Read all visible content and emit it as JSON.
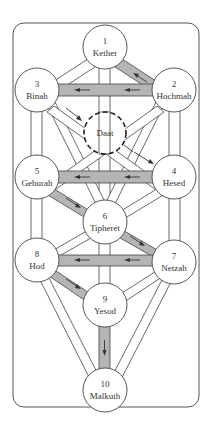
{
  "sephirot": [
    {
      "num": "1",
      "name": "Kether",
      "cx": 105,
      "cy": 47
    },
    {
      "num": "2",
      "name": "Hochmah",
      "cx": 174,
      "cy": 90
    },
    {
      "num": "3",
      "name": "Binah",
      "cx": 37,
      "cy": 90
    },
    {
      "num": "4",
      "name": "Hesed",
      "cx": 174,
      "cy": 177
    },
    {
      "num": "5",
      "name": "Geburah",
      "cx": 37,
      "cy": 177
    },
    {
      "num": "6",
      "name": "Tipheret",
      "cx": 105,
      "cy": 222
    },
    {
      "num": "7",
      "name": "Netzah",
      "cx": 174,
      "cy": 262
    },
    {
      "num": "8",
      "name": "Hod",
      "cx": 37,
      "cy": 260
    },
    {
      "num": "9",
      "name": "Yesod",
      "cx": 105,
      "cy": 305
    },
    {
      "num": "10",
      "name": "Malkuth",
      "cx": 105,
      "cy": 390
    }
  ],
  "hidden_sephirah": {
    "name": "Daat",
    "cx": 105,
    "cy": 133
  },
  "highlighted_paths": [
    "Kether-Hochmah",
    "Hochmah-Binah",
    "Hesed-Geburah",
    "Geburah-Tipheret",
    "Tipheret-Netzah",
    "Netzah-Hod",
    "Hod-Yesod",
    "Yesod-Malkuth"
  ],
  "colors": {
    "highlight": "#b5b5b5",
    "stroke": "#444444"
  }
}
